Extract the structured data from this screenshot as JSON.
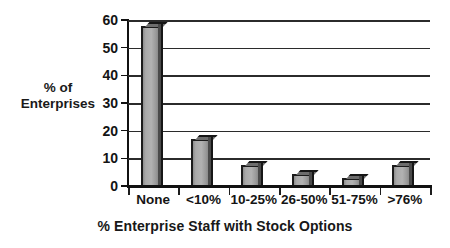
{
  "chart_data": {
    "type": "bar",
    "title": "",
    "subtitle": "",
    "xlabel": "% Enterprise Staff with Stock Options",
    "ylabel": "% of Enterprises",
    "ylabel_line1": "% of",
    "ylabel_line2": "Enterprises",
    "categories": [
      "None",
      "<10%",
      "10-25%",
      "26-50%",
      "51-75%",
      ">76%"
    ],
    "values": [
      58,
      17,
      7.5,
      4.5,
      3,
      7.5
    ],
    "ylim": [
      0,
      60
    ],
    "yticks": [
      0,
      10,
      20,
      30,
      40,
      50,
      60
    ],
    "ytick_labels": [
      "0",
      "10",
      "20",
      "30",
      "40",
      "50",
      "60"
    ],
    "grid": true,
    "grid_axis": "y",
    "legend": false,
    "legend_position": "none",
    "bar_color": "#a9a9a9",
    "bar_edge_color": "#1b1b1b",
    "axis_color": "#111111",
    "text_color": "#141414",
    "background_color": "#ffffff",
    "series": [
      {
        "name": "% of Enterprises",
        "values": [
          58,
          17,
          7.5,
          4.5,
          3,
          7.5
        ]
      }
    ]
  }
}
